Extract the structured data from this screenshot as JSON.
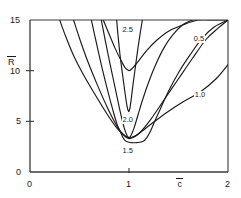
{
  "chart_data": {
    "type": "line",
    "title": "",
    "subtitle": "",
    "xlabel": "c̄",
    "ylabel": "R̄",
    "xlim": [
      0,
      2
    ],
    "ylim": [
      0,
      15
    ],
    "xticks": [
      "0",
      "1",
      "2"
    ],
    "xtick_values": [
      0,
      1,
      2
    ],
    "yticks": [
      "0",
      "5",
      "10",
      "15"
    ],
    "ytick_values": [
      0,
      5,
      10,
      15
    ],
    "grid": false,
    "legend": "inline-curve-labels",
    "annotations": [
      {
        "label": "2.5",
        "x": 1.0,
        "y": 14.0
      },
      {
        "label": "0.5",
        "x": 1.72,
        "y": 13.1
      },
      {
        "label": "1.0",
        "x": 1.73,
        "y": 7.6
      },
      {
        "label": "2.0",
        "x": 1.0,
        "y": 5.1
      },
      {
        "label": "1.5",
        "x": 1.0,
        "y": 2.1
      }
    ],
    "series": [
      {
        "name": "0.5",
        "label": "0.5",
        "x": [
          0.3,
          0.36,
          0.44,
          0.54,
          0.66,
          0.78,
          0.88,
          0.97,
          1.02,
          1.1,
          1.22,
          1.36,
          1.5,
          1.64,
          1.78,
          1.9,
          2.0
        ],
        "values": [
          15.0,
          13.4,
          11.5,
          9.6,
          7.6,
          5.7,
          4.3,
          3.5,
          3.4,
          3.8,
          5.2,
          7.2,
          9.2,
          11.2,
          13.1,
          14.2,
          15.0
        ]
      },
      {
        "name": "1.0",
        "label": "1.0",
        "x": [
          0.44,
          0.5,
          0.58,
          0.68,
          0.78,
          0.88,
          0.95,
          1.0,
          1.06,
          1.14,
          1.26,
          1.4,
          1.56,
          1.72,
          1.88,
          2.0
        ],
        "values": [
          15.0,
          13.2,
          11.0,
          8.6,
          6.4,
          4.5,
          3.6,
          3.3,
          3.5,
          4.1,
          5.0,
          6.0,
          7.0,
          7.9,
          9.2,
          10.6
        ]
      },
      {
        "name": "1.5",
        "label": "1.5",
        "x": [
          0.62,
          0.66,
          0.72,
          0.78,
          0.84,
          0.88,
          0.92,
          0.96,
          1.02,
          1.08,
          1.14,
          1.18,
          1.22,
          1.26,
          1.32,
          1.4,
          1.5,
          1.62,
          1.74,
          1.86,
          2.0
        ],
        "values": [
          15.0,
          13.2,
          10.6,
          8.2,
          6.0,
          4.7,
          3.8,
          3.1,
          2.9,
          2.9,
          3.0,
          3.4,
          4.1,
          5.0,
          6.3,
          8.0,
          9.8,
          11.6,
          13.2,
          14.3,
          15.0
        ]
      },
      {
        "name": "2.0",
        "label": "2.0",
        "x": [
          0.72,
          0.76,
          0.81,
          0.86,
          0.91,
          0.95,
          0.98,
          1.0,
          1.02,
          1.05,
          1.09,
          1.14,
          1.2,
          1.27,
          1.35,
          1.44,
          1.54,
          1.64
        ],
        "values": [
          15.0,
          13.0,
          10.6,
          8.3,
          6.0,
          4.4,
          3.6,
          3.4,
          3.6,
          4.3,
          5.6,
          7.2,
          8.9,
          10.6,
          12.2,
          13.5,
          14.5,
          15.0
        ]
      },
      {
        "name": "2.5",
        "label": "2.5",
        "x": [
          0.875,
          0.89,
          0.91,
          0.935,
          0.96,
          0.98,
          0.995,
          1.005,
          1.02,
          1.04,
          1.065,
          1.09,
          1.115,
          1.135
        ],
        "values": [
          15.0,
          13.4,
          11.5,
          9.6,
          7.8,
          6.5,
          6.0,
          6.1,
          7.0,
          8.6,
          10.4,
          12.2,
          13.8,
          15.0
        ]
      },
      {
        "name": "envelope",
        "label": "",
        "x": [
          0.74,
          0.8,
          0.86,
          0.92,
          0.96,
          1.0,
          1.04,
          1.1,
          1.18,
          1.28,
          1.4,
          1.54,
          1.7,
          1.86,
          2.0
        ],
        "values": [
          15.0,
          13.6,
          12.2,
          11.0,
          10.3,
          10.0,
          10.3,
          11.0,
          12.0,
          13.0,
          13.9,
          14.5,
          15.0,
          15.0,
          15.0
        ]
      }
    ]
  },
  "axes": {
    "y_title": "R",
    "x_title": "c"
  }
}
